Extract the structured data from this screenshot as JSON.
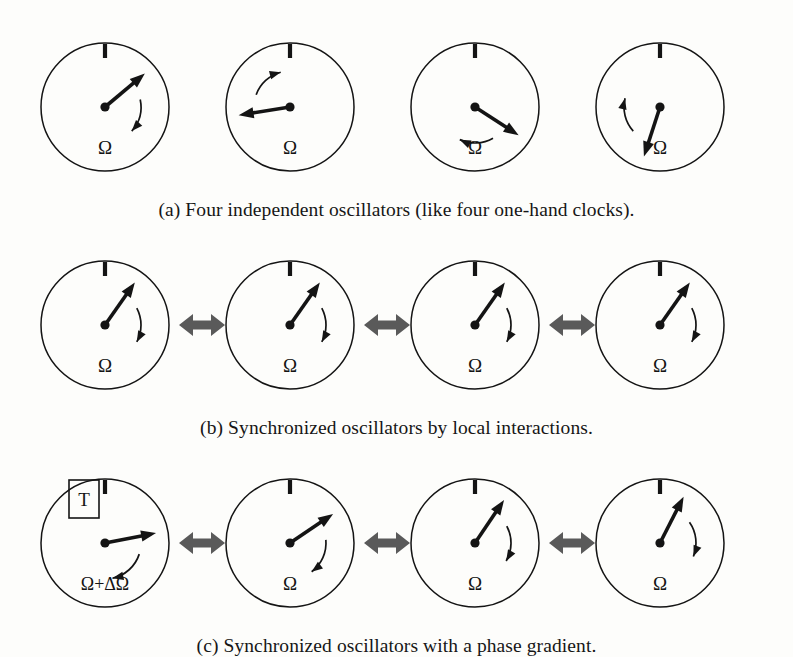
{
  "figure": {
    "background_color": "#fdfdfb",
    "ink_color": "#141414",
    "connector_color": "#5a5a5a",
    "rows": [
      {
        "id": "a",
        "caption": "(a) Four independent oscillators (like four one-hand clocks).",
        "connected": false,
        "clocks": [
          {
            "hand_angle_deg": 50,
            "arc_direction": "cw",
            "arc_start_deg": 78,
            "arc_end_deg": 132,
            "label": "Ω",
            "label_kind": "omega",
            "boxed_marker": null
          },
          {
            "hand_angle_deg": 261,
            "arc_direction": "cw",
            "arc_start_deg": 290,
            "arc_end_deg": 345,
            "label": "Ω",
            "label_kind": "omega",
            "boxed_marker": null
          },
          {
            "hand_angle_deg": 123,
            "arc_direction": "cw",
            "arc_start_deg": 150,
            "arc_end_deg": 205,
            "label": "Ω",
            "label_kind": "omega",
            "boxed_marker": null
          },
          {
            "hand_angle_deg": 198,
            "arc_direction": "cw",
            "arc_start_deg": 228,
            "arc_end_deg": 284,
            "label": "Ω",
            "label_kind": "omega",
            "boxed_marker": null
          }
        ]
      },
      {
        "id": "b",
        "caption": "(b) Synchronized oscillators by local interactions.",
        "connected": true,
        "clocks": [
          {
            "hand_angle_deg": 35,
            "arc_direction": "cw",
            "arc_start_deg": 62,
            "arc_end_deg": 118,
            "label": "Ω",
            "label_kind": "omega",
            "boxed_marker": null
          },
          {
            "hand_angle_deg": 35,
            "arc_direction": "cw",
            "arc_start_deg": 62,
            "arc_end_deg": 118,
            "label": "Ω",
            "label_kind": "omega",
            "boxed_marker": null
          },
          {
            "hand_angle_deg": 35,
            "arc_direction": "cw",
            "arc_start_deg": 62,
            "arc_end_deg": 118,
            "label": "Ω",
            "label_kind": "omega",
            "boxed_marker": null
          },
          {
            "hand_angle_deg": 35,
            "arc_direction": "cw",
            "arc_start_deg": 62,
            "arc_end_deg": 118,
            "label": "Ω",
            "label_kind": "omega",
            "boxed_marker": null
          }
        ]
      },
      {
        "id": "c",
        "caption": "(c) Synchronized oscillators with a phase gradient.",
        "connected": true,
        "clocks": [
          {
            "hand_angle_deg": 79,
            "arc_direction": "cw",
            "arc_start_deg": 108,
            "arc_end_deg": 168,
            "label": "Ω+ΔΩ",
            "label_kind": "omega-delta",
            "boxed_marker": "T"
          },
          {
            "hand_angle_deg": 56,
            "arc_direction": "cw",
            "arc_start_deg": 85,
            "arc_end_deg": 143,
            "label": "Ω",
            "label_kind": "omega",
            "boxed_marker": null
          },
          {
            "hand_angle_deg": 34,
            "arc_direction": "cw",
            "arc_start_deg": 62,
            "arc_end_deg": 120,
            "label": "Ω",
            "label_kind": "omega",
            "boxed_marker": null
          },
          {
            "hand_angle_deg": 27,
            "arc_direction": "cw",
            "arc_start_deg": 55,
            "arc_end_deg": 112,
            "label": "Ω",
            "label_kind": "omega",
            "boxed_marker": null
          }
        ]
      }
    ],
    "clock_geometry": {
      "radius": 64,
      "hand_length": 52,
      "tick_label": "12-oclock-tick",
      "centers_x": [
        105,
        290,
        475,
        660
      ],
      "row_center_y": [
        107,
        325,
        543
      ]
    },
    "connector": {
      "label": "bidirectional-coupling-arrow",
      "centers_x": [
        202,
        387,
        572
      ]
    }
  }
}
